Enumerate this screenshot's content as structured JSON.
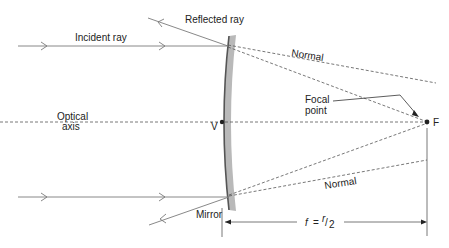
{
  "diagram": {
    "labels": {
      "incident_ray": "Incident ray",
      "reflected_ray": "Reflected ray",
      "normal_top": "Normal",
      "normal_bottom": "Normal",
      "optical_axis_line1": "Optical",
      "optical_axis_line2": "axis",
      "vertex": "V",
      "focal_point_line1": "Focal",
      "focal_point_line2": "point",
      "focus": "F",
      "mirror": "Mirror",
      "focal_length_f": "f",
      "focal_length_eq": "=",
      "focal_length_r": "r",
      "focal_length_slash": "/",
      "focal_length_2": "2"
    },
    "colors": {
      "line": "#7a7a7a",
      "dashed": "#555555",
      "mirror_fill": "#b9b9b9",
      "mirror_edge": "#555555",
      "text": "#222222",
      "background": "#ffffff"
    }
  }
}
